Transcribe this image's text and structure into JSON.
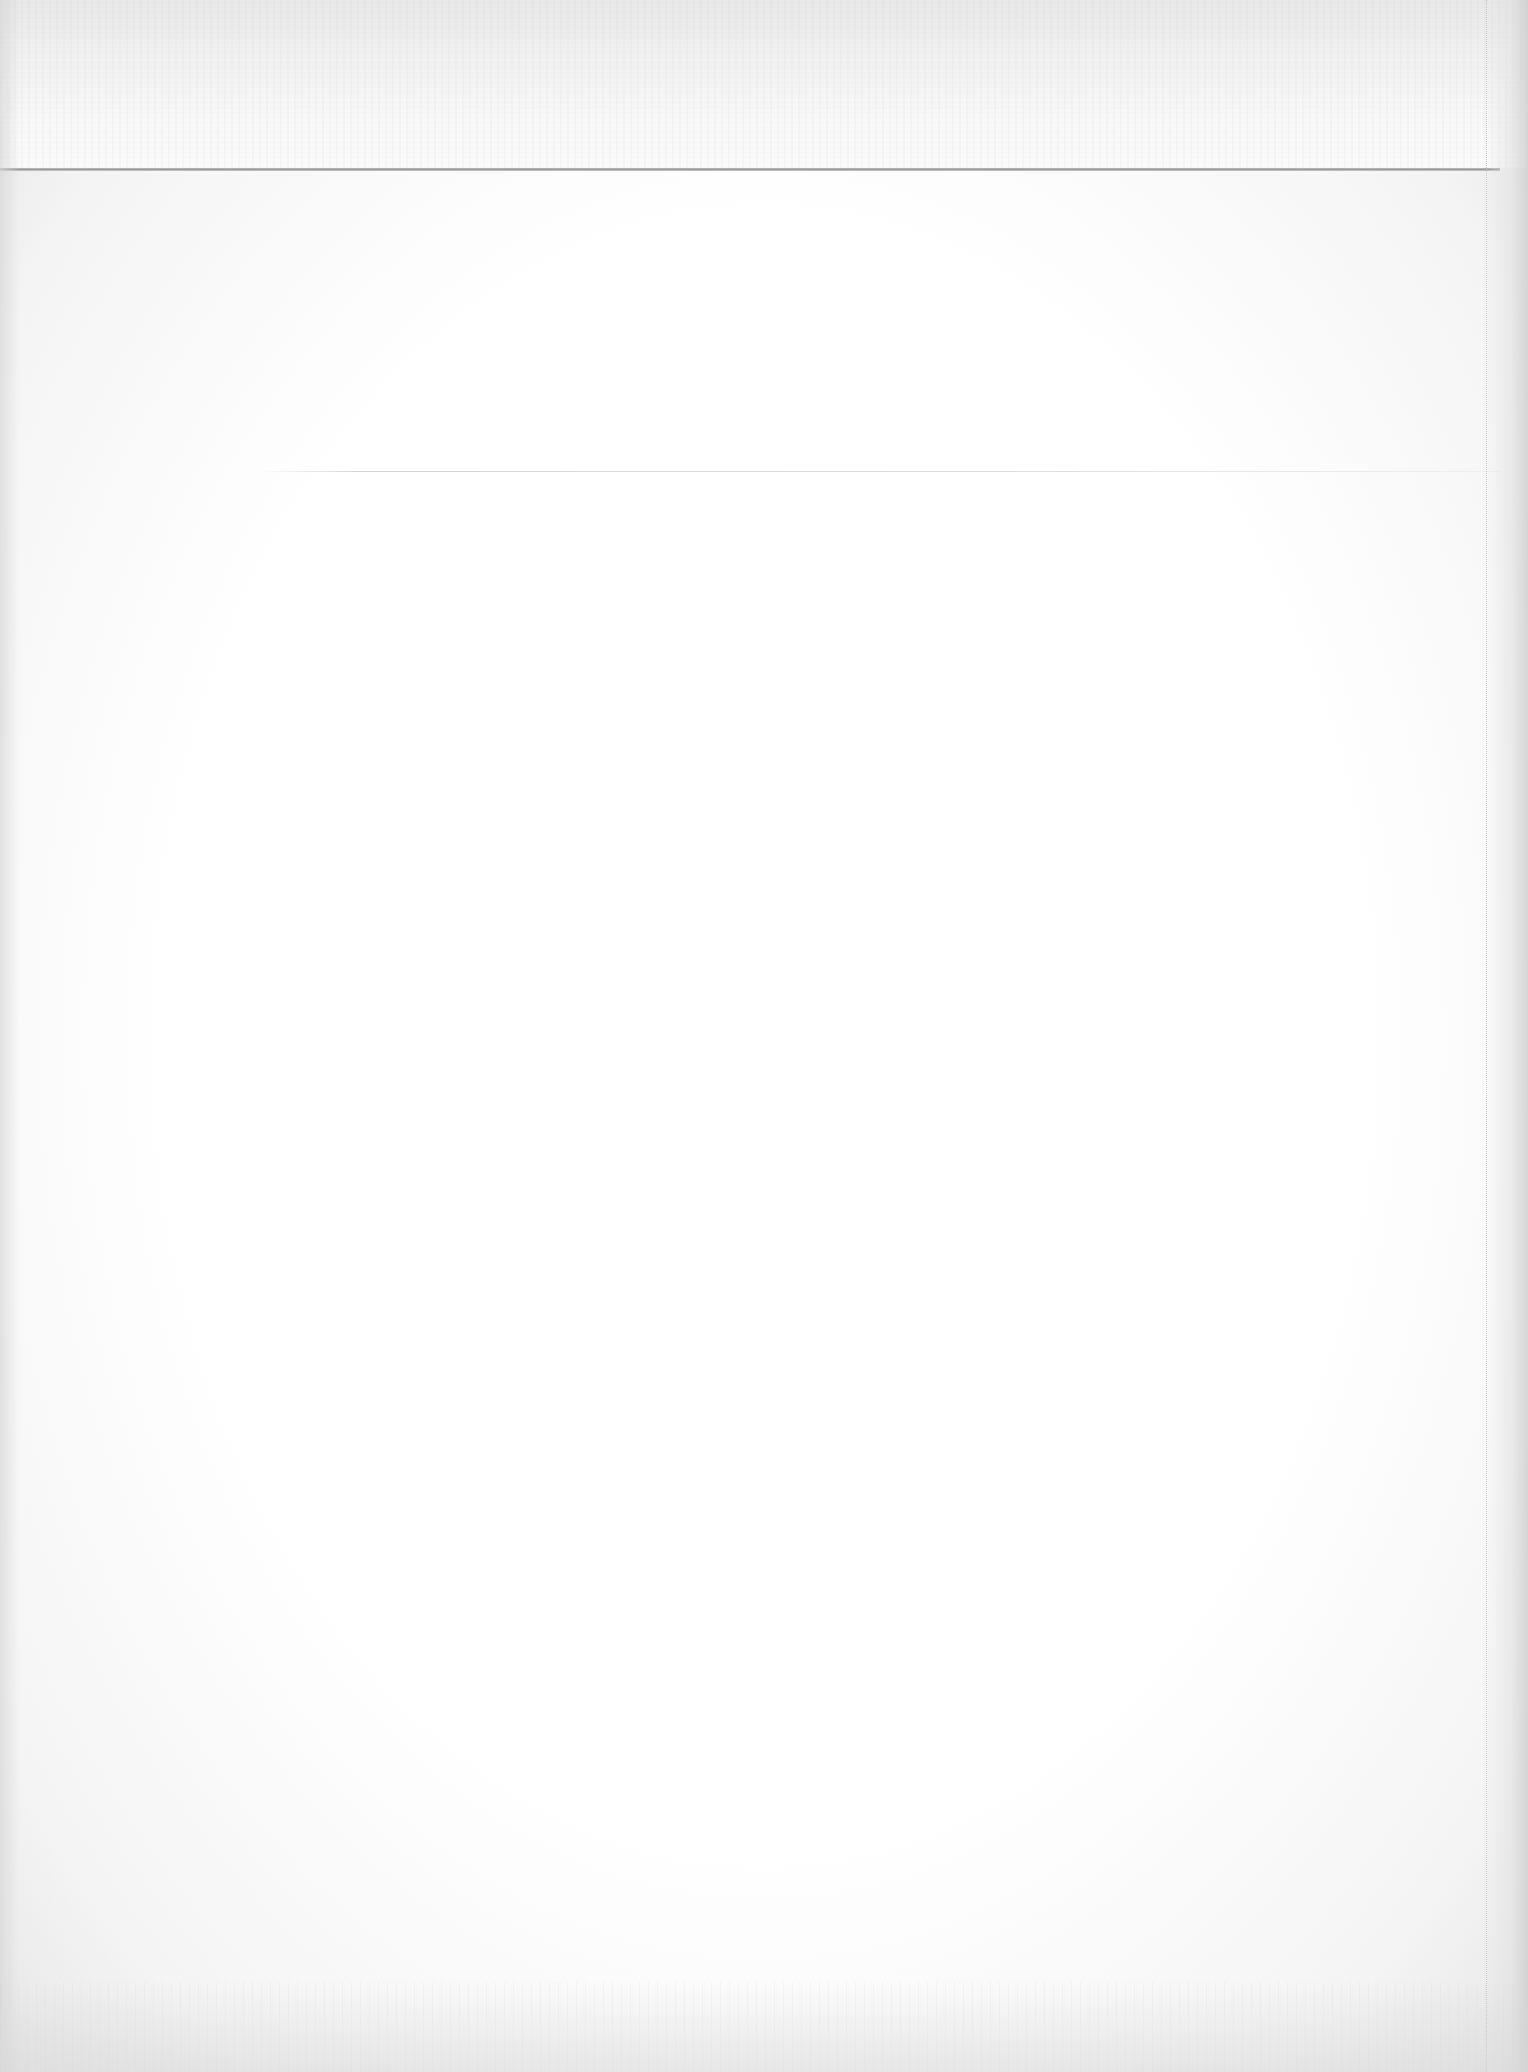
{
  "document": {
    "type": "scanned-blank-page",
    "text_content": "",
    "colors": {
      "paper": "#fdfdfd",
      "top_band": "#eeeeee",
      "rule": "#9a9a9a",
      "fold_line": "#c9c9c9"
    }
  }
}
